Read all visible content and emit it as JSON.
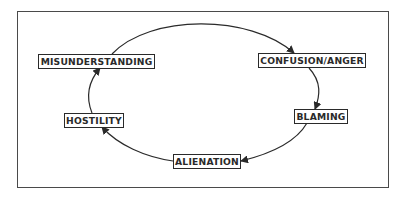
{
  "diagram": {
    "type": "cycle",
    "nodes": [
      {
        "id": "misunderstanding",
        "label": "MISUNDERSTANDING"
      },
      {
        "id": "confusion_anger",
        "label": "CONFUSION/ANGER"
      },
      {
        "id": "blaming",
        "label": "BLAMING"
      },
      {
        "id": "alienation",
        "label": "ALIENATION"
      },
      {
        "id": "hostility",
        "label": "HOSTILITY"
      }
    ],
    "edges": [
      {
        "from": "misunderstanding",
        "to": "confusion_anger"
      },
      {
        "from": "confusion_anger",
        "to": "blaming"
      },
      {
        "from": "blaming",
        "to": "alienation"
      },
      {
        "from": "alienation",
        "to": "hostility"
      },
      {
        "from": "hostility",
        "to": "misunderstanding"
      }
    ],
    "colors": {
      "stroke": "#2a2a2a",
      "frame": "#4a4a4a",
      "background": "#ffffff"
    }
  }
}
